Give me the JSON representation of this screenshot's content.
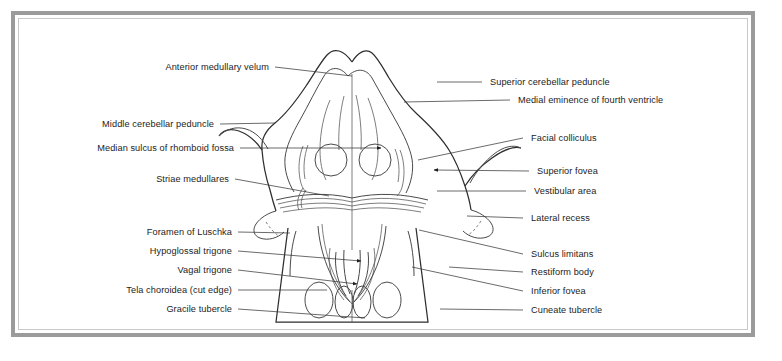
{
  "figure": {
    "frame_color": "#9b9b9b",
    "background_color": "#ffffff",
    "line_color": "#2e2e2e",
    "text_color": "#1c1c1c"
  },
  "labels_left": [
    {
      "text": "Anterior medullary velum",
      "x": 141,
      "y": 62,
      "right": 269,
      "line_to_x": 352,
      "line_to_y": 76
    },
    {
      "text": "Middle cerebellar peduncle",
      "x": 84,
      "y": 119,
      "right": 214,
      "line_to_x": 275,
      "line_to_y": 123
    },
    {
      "text": "Median sulcus of rhomboid fossa",
      "x": 76,
      "y": 143,
      "right": 234,
      "line_to_x": 381,
      "line_to_y": 148
    },
    {
      "text": "Striae medullares",
      "x": 148,
      "y": 174,
      "right": 229,
      "line_to_x": 329,
      "line_to_y": 196
    },
    {
      "text": "Foramen of Luschka",
      "x": 111,
      "y": 227,
      "right": 232,
      "line_to_x": 290,
      "line_to_y": 233
    },
    {
      "text": "Hypoglossal trigone",
      "x": 119,
      "y": 246,
      "right": 232,
      "line_to_x": 361,
      "line_to_y": 261
    },
    {
      "text": "Vagal trigone",
      "x": 165,
      "y": 265,
      "right": 232,
      "line_to_x": 357,
      "line_to_y": 284
    },
    {
      "text": "Tela choroidea (cut edge)",
      "x": 92,
      "y": 285,
      "right": 232,
      "line_to_x": 327,
      "line_to_y": 290
    },
    {
      "text": "Gracile tubercle",
      "x": 150,
      "y": 304,
      "right": 232,
      "line_to_x": 365,
      "line_to_y": 318
    }
  ],
  "labels_right": [
    {
      "text": "Superior cerebellar peduncle",
      "x": 490,
      "y": 77,
      "line_from_x": 437,
      "line_from_y": 82,
      "line_x": 484
    },
    {
      "text": "Medial eminence of fourth ventricle",
      "x": 518,
      "y": 95,
      "line_from_x": 404,
      "line_from_y": 102,
      "line_x": 512
    },
    {
      "text": "Facial colliculus",
      "x": 531,
      "y": 133,
      "line_from_x": 418,
      "line_from_y": 160,
      "line_x": 525
    },
    {
      "text": "Superior fovea",
      "x": 537,
      "y": 166,
      "line_from_x": 434,
      "line_from_y": 170,
      "line_x": 531
    },
    {
      "text": "Vestibular area",
      "x": 534,
      "y": 186,
      "line_from_x": 437,
      "line_from_y": 191,
      "line_x": 528
    },
    {
      "text": "Lateral recess",
      "x": 531,
      "y": 213,
      "line_from_x": 467,
      "line_from_y": 216,
      "line_x": 525
    },
    {
      "text": "Sulcus limitans",
      "x": 531,
      "y": 249,
      "line_from_x": 419,
      "line_from_y": 230,
      "line_x": 525
    },
    {
      "text": "Restiform body",
      "x": 531,
      "y": 267,
      "line_from_x": 449,
      "line_from_y": 267,
      "line_x": 525
    },
    {
      "text": "Inferior fovea",
      "x": 531,
      "y": 286,
      "line_from_x": 412,
      "line_from_y": 267,
      "line_x": 525
    },
    {
      "text": "Cuneate tubercle",
      "x": 531,
      "y": 305,
      "line_from_x": 440,
      "line_from_y": 309,
      "line_x": 525
    }
  ]
}
